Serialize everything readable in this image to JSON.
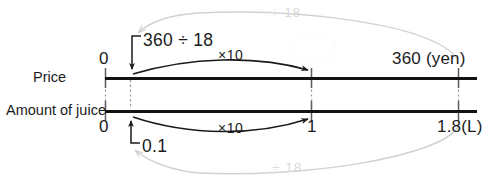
{
  "diagram": {
    "rows": [
      {
        "name": "Price",
        "unit_label": "360 (yen)"
      },
      {
        "name": "Amount of juice",
        "unit_label": "1.8(L)"
      }
    ],
    "axes": {
      "price": {
        "label": "Price",
        "zero": "0",
        "mid": "",
        "end": "360 (yen)"
      },
      "juice": {
        "label": "Amount of juice",
        "zero": "0",
        "mid": "1",
        "end": "1.8(L)"
      }
    },
    "annotations": {
      "unit_price_formula": "360 ÷ 18",
      "unit_amount": "0.1",
      "multiply_top": "×10",
      "multiply_bottom": "×10",
      "divide_top": "÷ 18",
      "divide_bottom": "÷ 18"
    },
    "answer_box": {
      "value": "",
      "placeholder": ""
    },
    "colors": {
      "line": "#121212",
      "tick": "#8d8d8d",
      "black_arrow": "#1b1b1b",
      "gray_arrow": "#d2d2d2",
      "gray_text": "#d9d9d9",
      "background": "#ffffff"
    }
  }
}
